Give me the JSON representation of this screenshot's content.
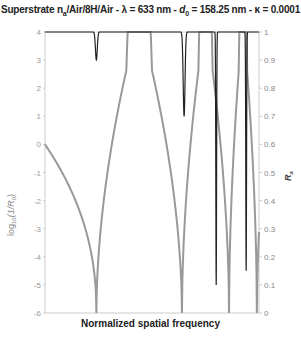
{
  "chart_data": {
    "type": "line",
    "title_parts": {
      "pre": "Superstrate n",
      "sub1": "a",
      "mid": "/Air/8H/Air - λ = 633 nm - ",
      "d": "d",
      "sub2": "0",
      "post": " = 158.25 nm - κ = 0.0001"
    },
    "xlabel": "Normalized spatial frequency",
    "ylabel_left": "log10(1/R0)",
    "ylabel_right": "Ra",
    "ylim_left": [
      -6,
      4
    ],
    "ylim_right": [
      0,
      1
    ],
    "yticks_left": [
      "4",
      "3",
      "2",
      "1",
      "0",
      "-1",
      "-2",
      "-3",
      "-4",
      "-5",
      "-6"
    ],
    "yticks_right": [
      "1",
      "0.9",
      "0.8",
      "0.7",
      "0.6",
      "0.5",
      "0.4",
      "0.3",
      "0.2",
      "0.1",
      "0"
    ],
    "grid": false,
    "series": [
      {
        "name": "log10(1/R0)",
        "axis": "left",
        "color": "#999999",
        "resonances_x": [
          0.24,
          0.64,
          0.86,
          0.99
        ],
        "description": "cusp-shaped dips from 4 down to -6 at resonance positions; starts at 0 at x=0"
      },
      {
        "name": "Ra",
        "axis": "right",
        "color": "#222222",
        "dips": [
          {
            "x": 0.24,
            "min": 0.9
          },
          {
            "x": 0.65,
            "min": 0.7
          },
          {
            "x": 0.8,
            "min": 0.1
          },
          {
            "x": 0.94,
            "min": 0.15
          }
        ],
        "baseline": 1.0
      }
    ]
  },
  "labels": {
    "ylabel_left_main": "log",
    "ylabel_left_sub": "10",
    "ylabel_left_rest": "(1/R",
    "ylabel_left_sub2": "0",
    "ylabel_left_end": ")",
    "ylabel_right_main": "R",
    "ylabel_right_sub": "a",
    "xlabel": "Normalized spatial frequency"
  }
}
